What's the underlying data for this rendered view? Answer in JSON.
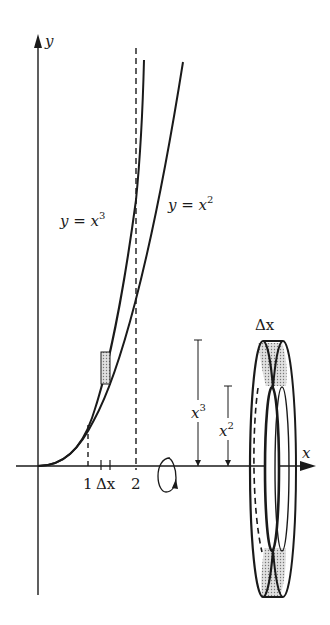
{
  "diagram": {
    "type": "washer-method-volume-of-revolution",
    "curves": [
      {
        "name": "cubic",
        "label": "y = x",
        "exponent": "3"
      },
      {
        "name": "square",
        "label": "y = x",
        "exponent": "2"
      }
    ],
    "axes": {
      "x_label": "x",
      "y_label": "y"
    },
    "ticks": {
      "one": "1",
      "two": "2",
      "delta": "Δx"
    },
    "washer": {
      "width_label": "Δx",
      "outer_radius_label": "x",
      "outer_radius_exp": "3",
      "inner_radius_label": "x",
      "inner_radius_exp": "2"
    },
    "rotation_symbol": "rotation-arrow-about-x-axis",
    "colors": {
      "ink": "#1a1a1a",
      "shade": "#bdbdbd",
      "background": "#ffffff"
    }
  }
}
